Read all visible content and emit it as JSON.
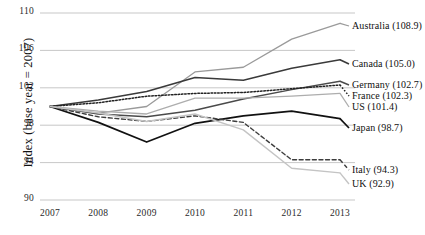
{
  "chart_data": {
    "type": "line",
    "title": "",
    "xlabel": "",
    "ylabel": "Index (base year = 2007)",
    "x": [
      2007,
      2008,
      2009,
      2010,
      2011,
      2012,
      2013
    ],
    "xticklabels": [
      "2007",
      "2008",
      "2009",
      "2010",
      "2011",
      "2012",
      "2013"
    ],
    "yticklabels": [
      "110",
      "106",
      "102",
      "98",
      "94",
      "90"
    ],
    "ytickvalues": [
      110,
      106,
      102,
      98,
      94,
      90
    ],
    "ylim": [
      90,
      110
    ],
    "xlim": [
      2007,
      2013
    ],
    "grid": "horizontal",
    "legend_position": "right-inline-end-of-line",
    "series": [
      {
        "name": "Australia",
        "end_value": "108.9",
        "label": "Australia (108.9)",
        "color": "#9a9a9a",
        "style": "solid",
        "width": 1.3,
        "values": [
          100.0,
          99.3,
          100.0,
          103.7,
          104.2,
          107.2,
          108.9
        ]
      },
      {
        "name": "Canada",
        "end_value": "105.0",
        "label": "Canada (105.0)",
        "color": "#3a3a3a",
        "style": "solid",
        "width": 1.6,
        "values": [
          100.0,
          100.7,
          101.6,
          103.1,
          102.8,
          104.1,
          105.0
        ]
      },
      {
        "name": "Germany",
        "end_value": "102.7",
        "label": "Germany (102.7)",
        "color": "#4a4a4a",
        "style": "solid",
        "width": 1.4,
        "values": [
          100.0,
          99.2,
          98.9,
          99.6,
          100.8,
          101.8,
          102.7
        ]
      },
      {
        "name": "France",
        "end_value": "102.3",
        "label": "France (102.3)",
        "color": "#222222",
        "style": "dotted",
        "width": 1.5,
        "values": [
          100.0,
          100.4,
          101.1,
          101.4,
          101.5,
          101.9,
          102.3
        ]
      },
      {
        "name": "US",
        "end_value": "101.4",
        "label": "US (101.4)",
        "color": "#adadad",
        "style": "solid",
        "width": 1.3,
        "values": [
          100.0,
          99.5,
          99.2,
          100.9,
          100.9,
          101.1,
          101.4
        ]
      },
      {
        "name": "Japan",
        "end_value": "98.7",
        "label": "Japan (98.7)",
        "color": "#111111",
        "style": "solid",
        "width": 1.7,
        "values": [
          100.0,
          98.3,
          96.2,
          98.2,
          99.0,
          99.5,
          98.7
        ]
      },
      {
        "name": "Italy",
        "end_value": "94.3",
        "label": "Italy (94.3)",
        "color": "#3d3d3d",
        "style": "dashed",
        "width": 1.4,
        "values": [
          100.0,
          98.9,
          98.4,
          99.0,
          98.3,
          94.3,
          94.3
        ]
      },
      {
        "name": "UK",
        "end_value": "92.9",
        "label": "UK (92.9)",
        "color": "#c4c4c4",
        "style": "solid",
        "width": 1.4,
        "values": [
          100.0,
          99.3,
          98.4,
          99.2,
          97.5,
          93.4,
          92.9
        ]
      }
    ],
    "label_positions": [
      {
        "name": "Australia",
        "x": 352,
        "y": 20
      },
      {
        "name": "Canada",
        "x": 352,
        "y": 58
      },
      {
        "name": "Germany",
        "x": 352,
        "y": 79
      },
      {
        "name": "France",
        "x": 352,
        "y": 90
      },
      {
        "name": "US",
        "x": 352,
        "y": 101
      },
      {
        "name": "Japan",
        "x": 352,
        "y": 122
      },
      {
        "name": "Italy",
        "x": 352,
        "y": 164
      },
      {
        "name": "UK",
        "x": 352,
        "y": 178
      }
    ]
  }
}
